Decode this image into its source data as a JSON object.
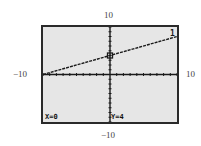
{
  "window": {
    "ymax_label": "10",
    "ymin_label": "−10",
    "xmin_label": "−10",
    "xmax_label": "10"
  },
  "trace": {
    "x_readout": "X=0",
    "y_readout": "Y=4",
    "equation_number": "1"
  },
  "colors": {
    "screen_bg": "#e6e6e6",
    "ink": "#1a1a1a"
  },
  "chart_data": {
    "type": "line",
    "title": "",
    "xlabel": "",
    "ylabel": "",
    "xlim": [
      -10,
      10
    ],
    "ylim": [
      -10,
      10
    ],
    "grid": false,
    "tick_marks": "every 1 unit on both axes",
    "series": [
      {
        "name": "1",
        "equation": "y = 0.4x + 4",
        "x": [
          -10,
          0,
          10
        ],
        "y": [
          0,
          4,
          8
        ]
      }
    ],
    "trace_point": {
      "x": 0,
      "y": 4
    },
    "annotations": [
      "X=0",
      "Y=4",
      "1"
    ]
  }
}
